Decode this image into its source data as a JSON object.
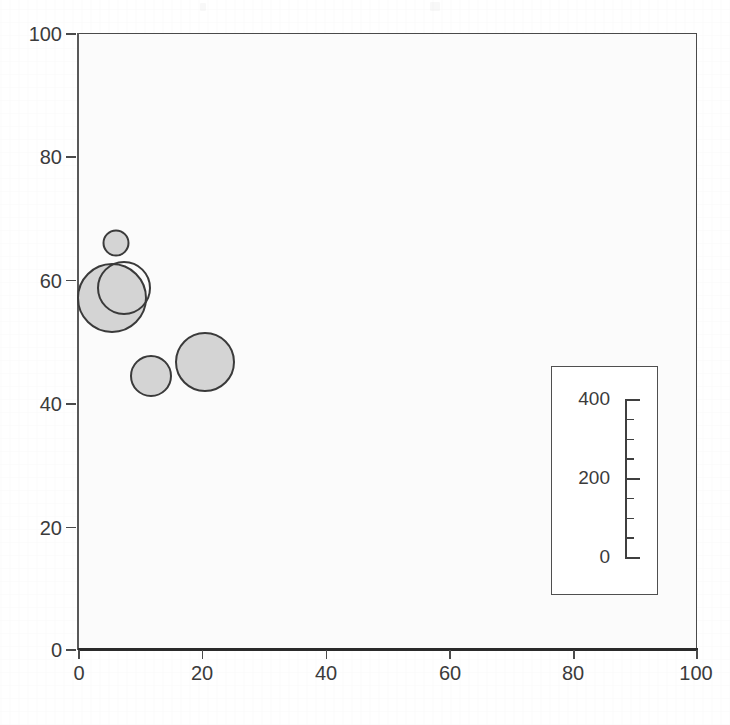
{
  "chart_data": {
    "type": "scatter",
    "variant": "bubble",
    "title": "",
    "subtitle": "",
    "xlabel": "",
    "ylabel": "",
    "xlim": [
      0,
      100
    ],
    "ylim": [
      0,
      100
    ],
    "grid": false,
    "legend_position": "inside-bottom-right",
    "x_ticks": [
      {
        "value": 0,
        "label": "0"
      },
      {
        "value": 20,
        "label": "20"
      },
      {
        "value": 40,
        "label": "40"
      },
      {
        "value": 60,
        "label": "60"
      },
      {
        "value": 80,
        "label": "80"
      },
      {
        "value": 100,
        "label": "100"
      }
    ],
    "y_ticks": [
      {
        "value": 0,
        "label": "0"
      },
      {
        "value": 20,
        "label": "20"
      },
      {
        "value": 40,
        "label": "40"
      },
      {
        "value": 60,
        "label": "60"
      },
      {
        "value": 80,
        "label": "80"
      },
      {
        "value": 100,
        "label": "100"
      }
    ],
    "points": [
      {
        "name": "bubble-1",
        "x": 6.1,
        "y": 66.0,
        "size": 55,
        "radius_px": 13.5,
        "filled": true
      },
      {
        "name": "bubble-2",
        "x": 5.5,
        "y": 57.0,
        "size": 400,
        "radius_px": 35.0,
        "filled": true
      },
      {
        "name": "bubble-3",
        "x": 7.4,
        "y": 58.6,
        "size": 235,
        "radius_px": 27.0,
        "filled": false
      },
      {
        "name": "bubble-4",
        "x": 11.8,
        "y": 44.4,
        "size": 140,
        "radius_px": 21.0,
        "filled": true
      },
      {
        "name": "bubble-5",
        "x": 20.5,
        "y": 46.6,
        "size": 290,
        "radius_px": 30.0,
        "filled": true
      }
    ],
    "size_legend": {
      "title": "",
      "ticks": [
        {
          "value": 400,
          "label": "400",
          "major": true
        },
        {
          "value": 350,
          "label": "",
          "major": false
        },
        {
          "value": 300,
          "label": "",
          "major": false
        },
        {
          "value": 250,
          "label": "",
          "major": false
        },
        {
          "value": 200,
          "label": "200",
          "major": true
        },
        {
          "value": 150,
          "label": "",
          "major": false
        },
        {
          "value": 100,
          "label": "",
          "major": false
        },
        {
          "value": 50,
          "label": "",
          "major": false
        },
        {
          "value": 0,
          "label": "0",
          "major": true
        }
      ],
      "range": [
        0,
        400
      ]
    },
    "colors": {
      "bubble_fill": "#d4d4d4",
      "bubble_stroke": "#3a3a3a",
      "plot_background": "#fbfbfb",
      "axis": "#4a4a4a",
      "text": "#3b3b3b",
      "legend_background": "#ffffff"
    }
  }
}
